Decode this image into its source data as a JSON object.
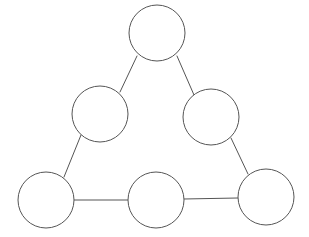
{
  "canvas": {
    "width": 309,
    "height": 237,
    "background_color": "#ffffff"
  },
  "style": {
    "node_stroke_color": "#555555",
    "node_fill_color": "#ffffff",
    "node_stroke_width": 1,
    "edge_stroke_color": "#555555",
    "edge_stroke_width": 1
  },
  "diagram": {
    "type": "node-link-graph",
    "shape": "triangle",
    "node_count": 6,
    "edge_count": 6,
    "nodes": [
      {
        "id": "apex",
        "label": "",
        "cx": 157,
        "cy": 33,
        "r": 28
      },
      {
        "id": "left-upper",
        "label": "",
        "cx": 100,
        "cy": 114,
        "r": 28
      },
      {
        "id": "right-upper",
        "label": "",
        "cx": 211,
        "cy": 117,
        "r": 28
      },
      {
        "id": "bottom-left",
        "label": "",
        "cx": 46,
        "cy": 200,
        "r": 28
      },
      {
        "id": "bottom-mid",
        "label": "",
        "cx": 156,
        "cy": 200,
        "r": 28
      },
      {
        "id": "bottom-right",
        "label": "",
        "cx": 266,
        "cy": 197,
        "r": 28
      }
    ],
    "edges": [
      {
        "id": "apex-left-upper",
        "from": "apex",
        "to": "left-upper",
        "x1": 137,
        "y1": 56,
        "x2": 120,
        "y2": 92
      },
      {
        "id": "apex-right-upper",
        "from": "apex",
        "to": "right-upper",
        "x1": 177,
        "y1": 56,
        "x2": 194,
        "y2": 95
      },
      {
        "id": "left-upper-bottom-left",
        "from": "left-upper",
        "to": "bottom-left",
        "x1": 81,
        "y1": 135,
        "x2": 64,
        "y2": 177
      },
      {
        "id": "right-upper-bottom-right",
        "from": "right-upper",
        "to": "bottom-right",
        "x1": 231,
        "y1": 138,
        "x2": 248,
        "y2": 174
      },
      {
        "id": "bottom-left-bottom-mid",
        "from": "bottom-left",
        "to": "bottom-mid",
        "x1": 74,
        "y1": 200,
        "x2": 128,
        "y2": 200
      },
      {
        "id": "bottom-mid-bottom-right",
        "from": "bottom-mid",
        "to": "bottom-right",
        "x1": 184,
        "y1": 199,
        "x2": 238,
        "y2": 198
      }
    ]
  }
}
